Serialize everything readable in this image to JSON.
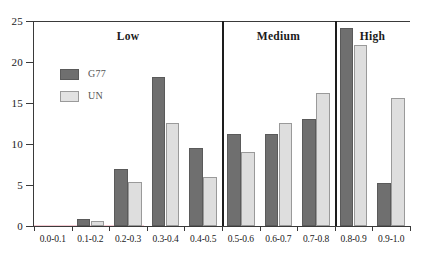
{
  "chart_data": {
    "type": "bar",
    "title": "",
    "subtitle": "",
    "xlabel": "",
    "ylabel": "",
    "ylim": [
      0,
      25
    ],
    "yticks": [
      0,
      5,
      10,
      15,
      20,
      25
    ],
    "grid": false,
    "legend_position": "upper-left-inside",
    "categories": [
      "0.0-0.1",
      "0.1-0.2",
      "0.2-0.3",
      "0.3-0.4",
      "0.4-0.5",
      "0.5-0.6",
      "0.6-0.7",
      "0.7-0.8",
      "0.8-0.9",
      "0.9-1.0"
    ],
    "series": [
      {
        "name": "G77",
        "color": "#6f6f6f",
        "values": [
          0,
          0.9,
          6.9,
          18.2,
          9.5,
          11.2,
          11.2,
          13.0,
          24.2,
          5.2
        ]
      },
      {
        "name": "UN",
        "color": "#dedede",
        "values": [
          0,
          0.6,
          5.4,
          12.6,
          6.0,
          9.0,
          12.6,
          16.2,
          22.1,
          15.6
        ]
      }
    ],
    "groups": [
      {
        "label": "Low",
        "categories": [
          "0.0-0.1",
          "0.1-0.2",
          "0.2-0.3",
          "0.3-0.4",
          "0.4-0.5"
        ]
      },
      {
        "label": "Medium",
        "categories": [
          "0.5-0.6",
          "0.6-0.7",
          "0.7-0.8"
        ]
      },
      {
        "label": "High",
        "categories": [
          "0.8-0.9",
          "0.9-1.0"
        ]
      }
    ],
    "annotations": []
  },
  "legend": {
    "items": [
      {
        "label": "G77",
        "swatch": "g77"
      },
      {
        "label": "UN",
        "swatch": "un"
      }
    ]
  },
  "colors": {
    "g77": "#6f6f6f",
    "un": "#dedede",
    "axis": "#3a3a3a",
    "divider": "#1d1d1d",
    "background": "#ffffff"
  }
}
